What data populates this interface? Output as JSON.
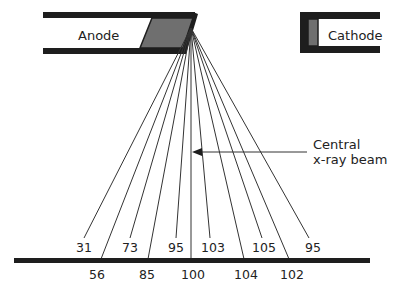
{
  "diagram": {
    "title": "",
    "components": {
      "anode_label": "Anode",
      "cathode_label": "Cathode",
      "central_beam_label_line1": "Central",
      "central_beam_label_line2": "x-ray beam"
    },
    "colors": {
      "structure": "#1e1e1e",
      "target": "#6f6f6f",
      "lines": "#333333",
      "text": "#222222"
    },
    "focal_point": [
      191,
      28
    ],
    "intensities_upper_row": [
      {
        "label": "31",
        "x": 84,
        "line_end": [
          84,
          238
        ]
      },
      {
        "label": "73",
        "x": 130,
        "line_end": [
          130,
          238
        ]
      },
      {
        "label": "95",
        "x": 176,
        "line_end": [
          176,
          238
        ]
      },
      {
        "label": "103",
        "x": 210,
        "line_end": [
          210,
          238
        ]
      },
      {
        "label": "105",
        "x": 262,
        "line_end": [
          262,
          238
        ]
      },
      {
        "label": "95",
        "x": 309,
        "line_end": [
          309,
          238
        ]
      }
    ],
    "intensities_lower_row": [
      {
        "label": "56",
        "x": 101,
        "line_end": [
          101,
          259
        ]
      },
      {
        "label": "85",
        "x": 148,
        "line_end": [
          148,
          259
        ]
      },
      {
        "label": "100",
        "x": 191,
        "line_end": [
          191,
          259
        ]
      },
      {
        "label": "104",
        "x": 244,
        "line_end": [
          244,
          259
        ]
      },
      {
        "label": "102",
        "x": 289,
        "line_end": [
          289,
          259
        ]
      }
    ],
    "intensity_sequence_left_to_right": [
      "31",
      "56",
      "73",
      "85",
      "95",
      "100",
      "103",
      "104",
      "105",
      "102",
      "95"
    ]
  }
}
